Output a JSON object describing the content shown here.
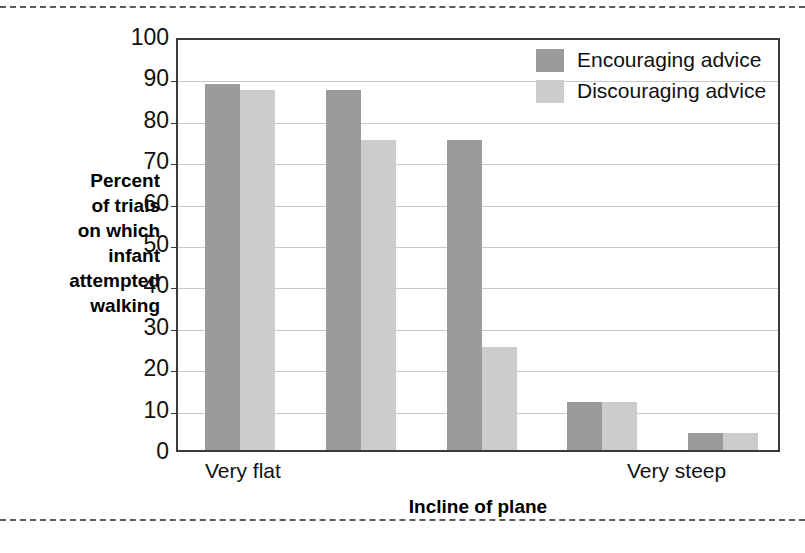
{
  "chart_data": {
    "type": "bar",
    "title": "",
    "xlabel": "Incline of plane",
    "ylabel": "Percent of trials on which infant attempted walking",
    "ylabel_lines": [
      "Percent",
      "of trials",
      "on which",
      "infant",
      "attempted",
      "walking"
    ],
    "categories": [
      "1",
      "2",
      "3",
      "4",
      "5"
    ],
    "x_tick_labels": [
      "Very flat",
      "Very steep"
    ],
    "series": [
      {
        "name": "Encouraging advice",
        "color": "#9b9b9b",
        "values": [
          88.5,
          87,
          75,
          11.5,
          4
        ]
      },
      {
        "name": "Discouraging advice",
        "color": "#cccccc",
        "values": [
          87,
          75,
          25,
          11.5,
          4
        ]
      }
    ],
    "ylim": [
      0,
      100
    ],
    "y_ticks": [
      0,
      10,
      20,
      30,
      40,
      50,
      60,
      70,
      80,
      90,
      100
    ],
    "y_tick_labels": [
      "0",
      "10",
      "20",
      "30",
      "40",
      "50",
      "60",
      "70",
      "80",
      "90",
      "100"
    ],
    "grid": true,
    "legend_position": "top-right"
  },
  "legend": {
    "entries": [
      {
        "label": "Encouraging advice"
      },
      {
        "label": "Discouraging advice"
      }
    ]
  }
}
